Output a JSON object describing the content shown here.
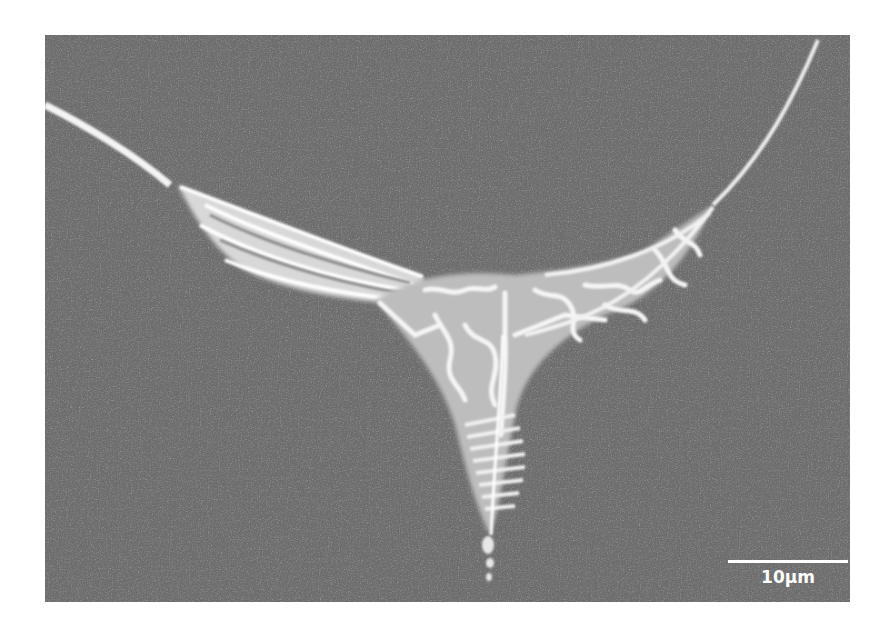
{
  "image": {
    "type": "SEM micrograph",
    "subject": "grain-boundary triple junction with eutectic/lamellar microstructure",
    "background_color": "#6e6e6e",
    "feature_color": "#f2f2f2"
  },
  "scale_bar": {
    "label": "10µm",
    "color": "#ffffff"
  }
}
